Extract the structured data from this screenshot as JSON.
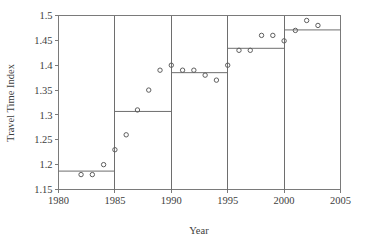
{
  "chart_data": {
    "type": "scatter",
    "title": "",
    "xlabel": "Year",
    "ylabel": "Travel Time Index",
    "xlim": [
      1980,
      2005
    ],
    "ylim": [
      1.15,
      1.5
    ],
    "xticks": [
      1980,
      1985,
      1990,
      1995,
      2000,
      2005
    ],
    "xtick_labels": [
      "1980",
      "1985",
      "1990",
      "1995",
      "2000",
      "2005"
    ],
    "yticks": [
      1.15,
      1.2,
      1.25,
      1.3,
      1.35,
      1.4,
      1.45,
      1.5
    ],
    "ytick_labels": [
      "1.15",
      "1.2",
      "1.25",
      "1.3",
      "1.35",
      "1.4",
      "1.45",
      "1.5"
    ],
    "grid": false,
    "legend": null,
    "series": [
      {
        "name": "Travel Time Index observations",
        "type": "scatter",
        "marker": "open-circle",
        "x": [
          1982,
          1983,
          1984,
          1985,
          1986,
          1987,
          1988,
          1989,
          1990,
          1991,
          1992,
          1993,
          1994,
          1995,
          1996,
          1997,
          1998,
          1999,
          2000,
          2001,
          2002,
          2003
        ],
        "y": [
          1.18,
          1.18,
          1.2,
          1.23,
          1.26,
          1.31,
          1.35,
          1.39,
          1.4,
          1.39,
          1.39,
          1.38,
          1.37,
          1.4,
          1.43,
          1.43,
          1.46,
          1.46,
          1.449,
          1.47,
          1.49,
          1.48
        ]
      },
      {
        "name": "Segment mean levels",
        "type": "step",
        "segments": [
          {
            "x_start": 1980,
            "x_end": 1985,
            "level": 1.187
          },
          {
            "x_start": 1985,
            "x_end": 1990,
            "level": 1.307
          },
          {
            "x_start": 1990,
            "x_end": 1995,
            "level": 1.385
          },
          {
            "x_start": 1995,
            "x_end": 2000,
            "level": 1.434
          },
          {
            "x_start": 2000,
            "x_end": 2005,
            "level": 1.471
          }
        ],
        "breakpoints": [
          1985,
          1990,
          1995,
          2000
        ]
      }
    ]
  },
  "colors": {
    "frame": "#7a7a7a",
    "step_line": "#6e6e6e",
    "marker_stroke": "#5e5e5e",
    "text": "#3d3d3d",
    "background": "#ffffff"
  }
}
